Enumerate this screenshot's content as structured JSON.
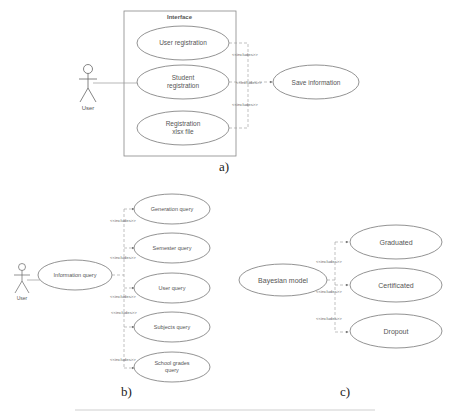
{
  "diagram_a": {
    "boundary_title": "Interface",
    "actor": "User",
    "use_cases": [
      "User registration",
      "Student registration",
      "Registration xlsx file"
    ],
    "use_case_lines": [
      [
        "User registration"
      ],
      [
        "Student",
        "registration"
      ],
      [
        "Registration",
        "xlsx file"
      ]
    ],
    "target": "Save information",
    "relation_label": "<<includes>>",
    "caption": "a)"
  },
  "diagram_b": {
    "actor": "User",
    "source": "Information query",
    "targets": [
      "Generation query",
      "Semester query",
      "User query",
      "Subjects query",
      "School grades query"
    ],
    "target_lines": [
      [
        "Generation query"
      ],
      [
        "Semester query"
      ],
      [
        "User query"
      ],
      [
        "Subjects query"
      ],
      [
        "School grades",
        "query"
      ]
    ],
    "relation_label": "<<includes>>",
    "caption": "b)"
  },
  "diagram_c": {
    "source": "Bayesian model",
    "targets": [
      "Graduated",
      "Certificated",
      "Dropout"
    ],
    "relation_label": "<<includes>>",
    "caption": "c)"
  }
}
